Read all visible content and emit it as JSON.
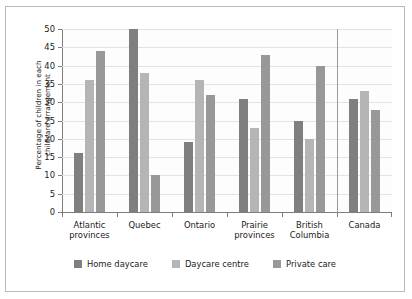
{
  "chart_data": {
    "type": "bar",
    "title": "",
    "xlabel": "",
    "ylabel": "Percentage of children in each childcare arrangement",
    "ylabel_lines": [
      "Percentage of children in each",
      "childcare arrangement"
    ],
    "categories": [
      "Atlantic\nprovinces",
      "Quebec",
      "Ontario",
      "Prairie\nprovinces",
      "British\nColumbia",
      "Canada"
    ],
    "series": [
      {
        "name": "Home daycare",
        "color": "#7f7f7f",
        "values": [
          16,
          50,
          19,
          31,
          25,
          31
        ]
      },
      {
        "name": "Daycare centre",
        "color": "#b5b5b5",
        "values": [
          36,
          38,
          36,
          23,
          20,
          33
        ]
      },
      {
        "name": "Private care",
        "color": "#989898",
        "values": [
          44,
          10,
          32,
          43,
          40,
          28
        ]
      }
    ],
    "ylim": [
      0,
      50
    ],
    "ytick_values": [
      0,
      5,
      10,
      15,
      20,
      25,
      30,
      35,
      40,
      45,
      50
    ],
    "ytick_labels": [
      "0",
      "5",
      "10",
      "15",
      "20",
      "25",
      "30",
      "35",
      "40",
      "45",
      "50"
    ],
    "grid": true,
    "legend_position": "bottom",
    "separator_before_category": "Canada"
  }
}
